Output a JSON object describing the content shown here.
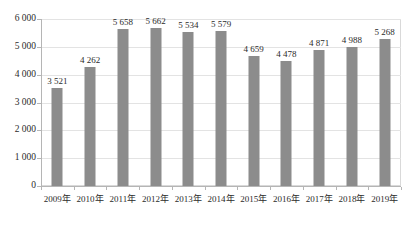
{
  "chart_data": {
    "type": "bar",
    "title": "",
    "subtitle": "",
    "xlabel": "",
    "ylabel": "",
    "categories": [
      "2009年",
      "2010年",
      "2011年",
      "2012年",
      "2013年",
      "2014年",
      "2015年",
      "2016年",
      "2017年",
      "2018年",
      "2019年"
    ],
    "values": [
      3521,
      4262,
      5658,
      5662,
      5534,
      5579,
      4659,
      4478,
      4871,
      4988,
      5268
    ],
    "value_labels": [
      "3 521",
      "4 262",
      "5 658",
      "5 662",
      "5 534",
      "5 579",
      "4 659",
      "4 478",
      "4 871",
      "4 988",
      "5 268"
    ],
    "ylim": [
      0,
      6000
    ],
    "ytick_values": [
      0,
      1000,
      2000,
      3000,
      4000,
      5000,
      6000
    ],
    "ytick_labels": [
      "0",
      "1 000",
      "2 000",
      "3 000",
      "4 000",
      "5 000",
      "6 000"
    ],
    "grid": true,
    "grid_axis": "y",
    "legend": false,
    "legend_position": "none",
    "bar_color": "#8c8c8c",
    "gridline_color": "#e3e3e3",
    "axis_color": "#b5b5b5",
    "plot_border_color": "#d9d9d9",
    "background_color": "#ffffff",
    "text_color": "#2b2b2b",
    "data_labels_shown": true
  }
}
